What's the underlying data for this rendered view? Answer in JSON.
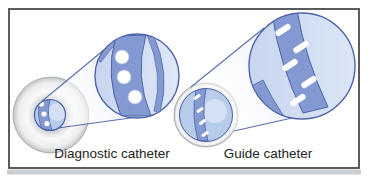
{
  "figure": {
    "type": "medical-illustration",
    "panels": {
      "left": {
        "label": "Diagnostic catheter"
      },
      "right": {
        "label": "Guide catheter"
      }
    }
  },
  "colors": {
    "background": "#ffffff",
    "border_dark": "#4a4a4a",
    "bottom_strip": "#c9cfd4",
    "label_text": "#222222",
    "band_blue": "#8499d2",
    "outline_blue": "#4d62a8",
    "cone_line": "#5a6fb0",
    "lumen_blue": "#b7cbeb",
    "highlight_blue": "#d4e1f4",
    "hole_white": "#ffffff",
    "hole_rim": "#aabbde"
  }
}
